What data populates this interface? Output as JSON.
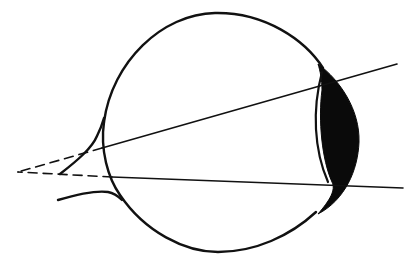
{
  "diagram": {
    "description": "Side view of eyeball with light rays converging behind the retina (dashed extensions meeting at a focal point)",
    "colors": {
      "background": "#ffffff",
      "line": "#111111",
      "lens_fill": "#0a0a0a"
    },
    "elements": {
      "eyeball": {
        "label": "eyeball",
        "cx": 215,
        "cy": 132,
        "r": 118
      },
      "lens": {
        "label": "lens"
      },
      "optic_nerve": {
        "label": "optic nerve"
      },
      "ray_upper": {
        "label": "upper light ray",
        "from": [
          397,
          64
        ],
        "to": [
          18,
          172
        ]
      },
      "ray_lower": {
        "label": "lower light ray",
        "from": [
          403,
          188
        ],
        "to": [
          18,
          172
        ]
      },
      "focal_point": {
        "label": "focal point behind eye",
        "x": 18,
        "y": 172
      }
    }
  }
}
